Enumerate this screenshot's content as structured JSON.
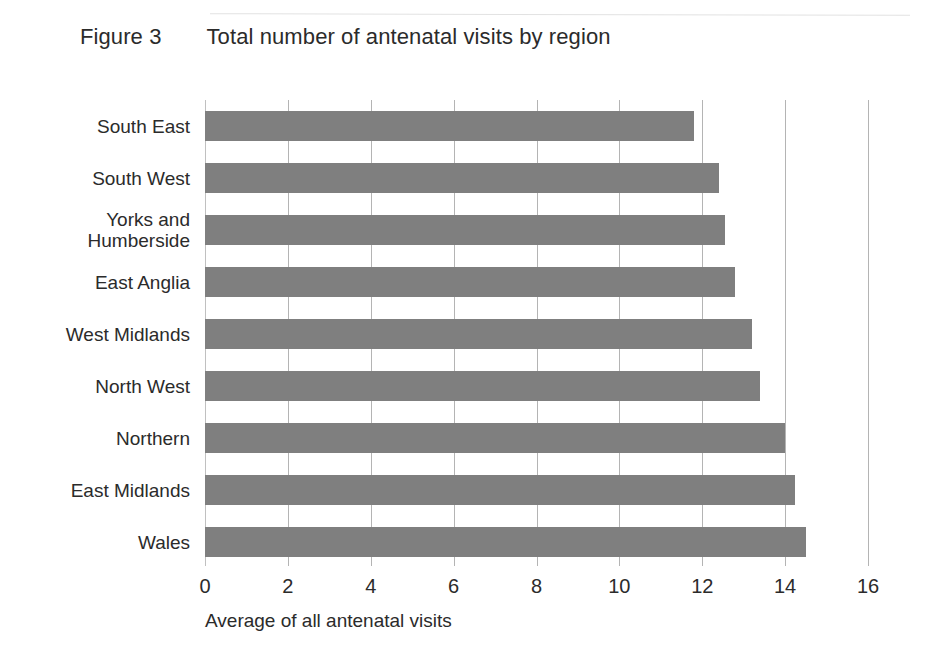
{
  "figure": {
    "label": "Figure 3",
    "title": "Total number of antenatal visits by region"
  },
  "colors": {
    "bar": "#7f7f7f",
    "gridline": "#b4b4b4",
    "text": "#2b2b2b",
    "background": "#ffffff"
  },
  "chart_data": {
    "type": "bar",
    "orientation": "horizontal",
    "title": "Total number of antenatal visits by region",
    "xlabel": "Average of all antenatal visits",
    "ylabel": "",
    "xlim": [
      0,
      16
    ],
    "xticks": [
      0,
      2,
      4,
      6,
      8,
      10,
      12,
      14,
      16
    ],
    "xtick_labels": [
      "0",
      "2",
      "4",
      "6",
      "8",
      "10",
      "12",
      "14",
      "16"
    ],
    "grid": "vertical",
    "legend": "none",
    "categories": [
      "South East",
      "South West",
      "Yorks and\nHumberside",
      "East Anglia",
      "West Midlands",
      "North West",
      "Northern",
      "East Midlands",
      "Wales"
    ],
    "values": [
      11.8,
      12.4,
      12.55,
      12.8,
      13.2,
      13.4,
      14.0,
      14.25,
      14.5
    ]
  }
}
